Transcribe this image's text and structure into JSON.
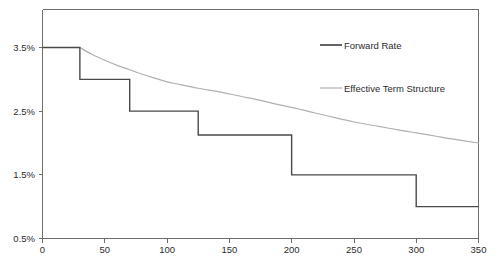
{
  "chart_data": {
    "type": "line",
    "title": "",
    "subtitle": "",
    "xlabel": "",
    "ylabel": "",
    "xlim": [
      0,
      350
    ],
    "ylim": [
      0.5,
      3.75
    ],
    "grid": false,
    "legend_position": "top-right",
    "xticks": [
      0,
      50,
      100,
      150,
      200,
      250,
      300,
      350
    ],
    "xtick_labels": [
      "0",
      "50",
      "100",
      "150",
      "200",
      "250",
      "300",
      "350"
    ],
    "yticks": [
      0.5,
      1.5,
      2.5,
      3.5
    ],
    "ytick_labels": [
      "0.5%",
      "1.5%",
      "2.5%",
      "3.5%"
    ],
    "series": [
      {
        "name": "Forward Rate",
        "style": "step",
        "color": "#4a4a4a",
        "steps": [
          {
            "x_start": 0,
            "x_end": 30,
            "value": 3.5
          },
          {
            "x_start": 30,
            "x_end": 70,
            "value": 3.0
          },
          {
            "x_start": 70,
            "x_end": 125,
            "value": 2.5
          },
          {
            "x_start": 125,
            "x_end": 200,
            "value": 2.125
          },
          {
            "x_start": 200,
            "x_end": 300,
            "value": 1.5
          },
          {
            "x_start": 300,
            "x_end": 350,
            "value": 1.0
          }
        ]
      },
      {
        "name": "Effective Term Structure",
        "style": "smooth",
        "color": "#b0b0b0",
        "x": [
          30,
          40,
          50,
          60,
          70,
          80,
          90,
          100,
          110,
          125,
          140,
          150,
          160,
          175,
          190,
          200,
          215,
          230,
          250,
          270,
          290,
          300,
          315,
          330,
          350
        ],
        "y": [
          3.5,
          3.39,
          3.3,
          3.22,
          3.15,
          3.08,
          3.02,
          2.96,
          2.92,
          2.86,
          2.81,
          2.77,
          2.73,
          2.67,
          2.6,
          2.56,
          2.49,
          2.42,
          2.33,
          2.26,
          2.19,
          2.16,
          2.11,
          2.06,
          2.0
        ]
      }
    ]
  },
  "legend": {
    "entries": [
      {
        "label": "Forward Rate",
        "swatch": "forward-rate-line-swatch"
      },
      {
        "label": "Effective Term Structure",
        "swatch": "effective-term-structure-line-swatch"
      }
    ]
  },
  "colors": {
    "forward_rate": "#4a4a4a",
    "effective_term_structure": "#b0b0b0",
    "axis": "#6e6e6e",
    "text": "#2b2b2b",
    "background": "#ffffff"
  }
}
